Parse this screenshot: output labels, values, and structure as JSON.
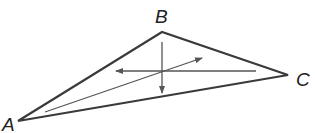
{
  "diagram": {
    "type": "triangle-with-arrows",
    "colors": {
      "stroke": "#3a3a3a",
      "arrow": "#555555",
      "label": "#222222"
    },
    "vertices": [
      {
        "id": "A",
        "label": "A",
        "x": 18,
        "y": 121,
        "label_x": 2,
        "label_y": 131
      },
      {
        "id": "B",
        "label": "B",
        "x": 162,
        "y": 32,
        "label_x": 155,
        "label_y": 23
      },
      {
        "id": "C",
        "label": "C",
        "x": 288,
        "y": 75,
        "label_x": 296,
        "label_y": 86
      }
    ],
    "arrows": [
      {
        "name": "horizontal-arrow",
        "x1": 256,
        "y1": 71,
        "x2": 116,
        "y2": 71
      },
      {
        "name": "vertical-arrow",
        "x1": 162,
        "y1": 42,
        "x2": 162,
        "y2": 93
      },
      {
        "name": "diagonal-arrow",
        "x1": 45,
        "y1": 112,
        "x2": 202,
        "y2": 58
      }
    ]
  }
}
